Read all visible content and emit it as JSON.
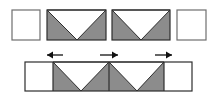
{
  "diagram": {
    "width": 214,
    "height": 99,
    "colors": {
      "background": "#ffffff",
      "fill": "#8c8c8c",
      "stroke": "#2e2e2e",
      "empty_stroke": "#6e6e6e"
    },
    "top_row": {
      "cells": [
        {
          "type": "empty",
          "x": 12,
          "y": 10,
          "w": 28,
          "h": 30
        },
        {
          "type": "triangle-notch",
          "x": 47,
          "y": 10,
          "w": 59,
          "h": 30,
          "apex_x": 77
        },
        {
          "type": "triangle-notch",
          "x": 112,
          "y": 10,
          "w": 58,
          "h": 30,
          "apex_x": 141
        },
        {
          "type": "empty",
          "x": 177,
          "y": 10,
          "w": 29,
          "h": 30
        }
      ]
    },
    "bottom_strip": {
      "x": 25,
      "y": 62,
      "w": 167,
      "h": 29,
      "dividers_x": [
        53,
        109,
        164
      ],
      "apexes_x": [
        81,
        137
      ],
      "arrows": [
        {
          "direction": "left",
          "x1": 63,
          "x2": 47,
          "y": 55
        },
        {
          "direction": "right",
          "x1": 100,
          "x2": 118,
          "y": 55
        },
        {
          "direction": "right",
          "x1": 155,
          "x2": 172,
          "y": 55
        }
      ]
    }
  }
}
